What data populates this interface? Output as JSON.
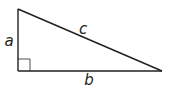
{
  "diagram": {
    "type": "right-triangle",
    "stroke_color": "#231f20",
    "vertices": {
      "top": [
        18,
        9
      ],
      "right_angle": [
        18,
        71
      ],
      "right": [
        162,
        71
      ]
    },
    "right_angle_marker_size": 12,
    "labels": {
      "a": {
        "text": "a",
        "x": 9,
        "y": 41
      },
      "b": {
        "text": "b",
        "x": 89,
        "y": 80
      },
      "c": {
        "text": "c",
        "x": 83,
        "y": 30
      }
    }
  }
}
